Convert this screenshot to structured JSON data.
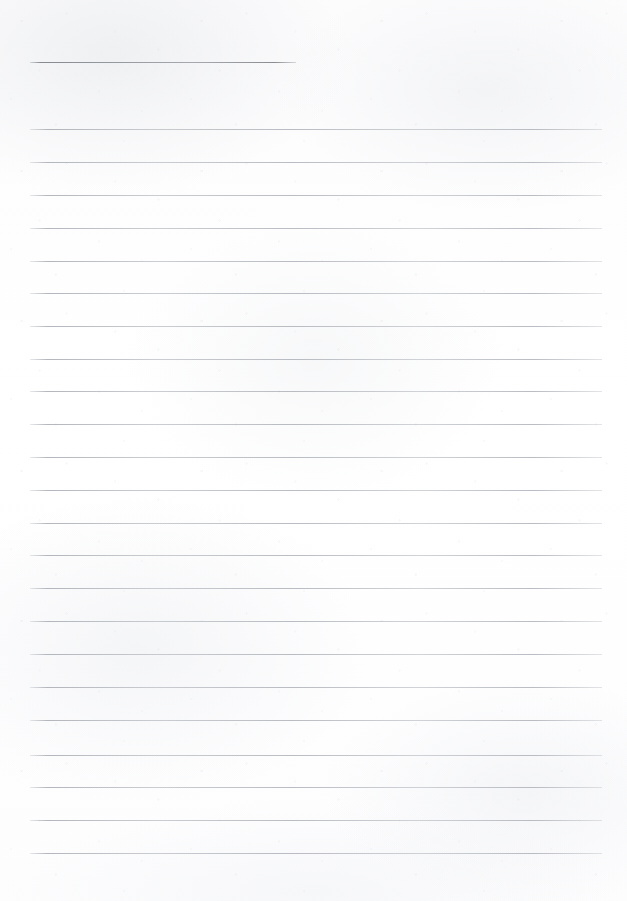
{
  "document": {
    "kind": "scanned-lined-worksheet",
    "title": "",
    "orientation": "portrait",
    "page_width": 627,
    "page_height": 901,
    "paper_color": "#fdfdfd",
    "title_rule_color": "#84888f",
    "body_rule_color": "#aaaeb5"
  },
  "title_rule": {
    "label": "",
    "x": 30,
    "y": 62,
    "width": 266,
    "thickness": 1
  },
  "body": {
    "left": 30,
    "right": 602,
    "width": 572,
    "line_spacing": 32.9,
    "first_line_y": 129,
    "line_count": 23,
    "lines": [
      {
        "index": 1,
        "y": 129,
        "text": ""
      },
      {
        "index": 2,
        "y": 162,
        "text": ""
      },
      {
        "index": 3,
        "y": 195,
        "text": ""
      },
      {
        "index": 4,
        "y": 228,
        "text": ""
      },
      {
        "index": 5,
        "y": 261,
        "text": ""
      },
      {
        "index": 6,
        "y": 293,
        "text": ""
      },
      {
        "index": 7,
        "y": 326,
        "text": ""
      },
      {
        "index": 8,
        "y": 359,
        "text": ""
      },
      {
        "index": 9,
        "y": 391,
        "text": ""
      },
      {
        "index": 10,
        "y": 424,
        "text": ""
      },
      {
        "index": 11,
        "y": 457,
        "text": ""
      },
      {
        "index": 12,
        "y": 490,
        "text": ""
      },
      {
        "index": 13,
        "y": 523,
        "text": ""
      },
      {
        "index": 14,
        "y": 555,
        "text": ""
      },
      {
        "index": 15,
        "y": 588,
        "text": ""
      },
      {
        "index": 16,
        "y": 621,
        "text": ""
      },
      {
        "index": 17,
        "y": 654,
        "text": ""
      },
      {
        "index": 18,
        "y": 687,
        "text": ""
      },
      {
        "index": 19,
        "y": 720,
        "text": ""
      },
      {
        "index": 20,
        "y": 755,
        "text": ""
      },
      {
        "index": 21,
        "y": 787,
        "text": ""
      },
      {
        "index": 22,
        "y": 820,
        "text": ""
      },
      {
        "index": 23,
        "y": 853,
        "text": ""
      }
    ]
  },
  "margins": {
    "top_blank_height": 62,
    "bottom_blank_height": 48
  }
}
